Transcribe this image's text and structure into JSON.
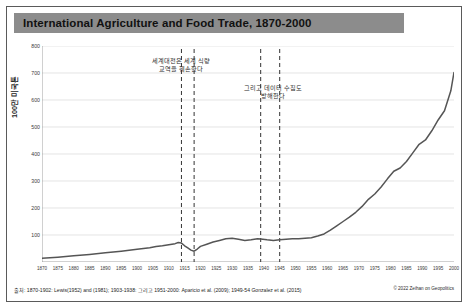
{
  "header": {
    "title": "International Agriculture and Food Trade, 1870-2000"
  },
  "footer": {
    "source": "출처: 1870-1902: Lewis(1952) and (1981); 1903-1938: 그리고 1951-2000: Aparicio et al. (2009); 1949-54 Gonzalez et al. (2015)",
    "credit": "© 2022 Zeihan on Geopolitics"
  },
  "annotations": [
    {
      "name": "world-wars-disrupt-trade",
      "line1": "세계대전은 세계 식량",
      "line2": "교역을 훼손한다"
    },
    {
      "name": "data-collection-disrupted",
      "line1": "그리고 데이터 수집도",
      "line2": "방해한다"
    }
  ],
  "colors": {
    "title_bar": "#8c8c8c",
    "line": "#555555",
    "grid": "#d9d9d9",
    "axis": "#8a8a8a",
    "marker_line": "#333333",
    "frame": "#5a5a5a"
  },
  "chart_data": {
    "type": "line",
    "title": "International Agriculture and Food Trade, 1870-2000",
    "xlabel": "",
    "ylabel": "100만 미국톤",
    "xlim": [
      1870,
      2000
    ],
    "ylim": [
      0,
      800
    ],
    "grid": true,
    "legend": "none",
    "xticks": [
      1870,
      1875,
      1880,
      1885,
      1890,
      1895,
      1900,
      1905,
      1910,
      1915,
      1920,
      1925,
      1930,
      1935,
      1940,
      1945,
      1950,
      1955,
      1960,
      1965,
      1970,
      1975,
      1980,
      1985,
      1990,
      1995,
      2000
    ],
    "yticks": [
      0,
      100,
      200,
      300,
      400,
      500,
      600,
      700,
      800
    ],
    "vlines": [
      {
        "x": 1914,
        "label": "WWI start"
      },
      {
        "x": 1918,
        "label": "WWI end"
      },
      {
        "x": 1939,
        "label": "WWII start"
      },
      {
        "x": 1945,
        "label": "WWII end"
      }
    ],
    "series": [
      {
        "name": "International agriculture and food trade",
        "x": [
          1870,
          1875,
          1880,
          1885,
          1890,
          1895,
          1900,
          1902,
          1904,
          1906,
          1908,
          1910,
          1912,
          1913,
          1914,
          1915,
          1916,
          1917,
          1918,
          1919,
          1920,
          1922,
          1924,
          1926,
          1928,
          1930,
          1932,
          1934,
          1936,
          1938,
          1939,
          1941,
          1943,
          1945,
          1947,
          1949,
          1951,
          1953,
          1955,
          1957,
          1959,
          1961,
          1963,
          1965,
          1967,
          1969,
          1971,
          1973,
          1975,
          1977,
          1979,
          1981,
          1983,
          1985,
          1987,
          1989,
          1991,
          1993,
          1995,
          1997,
          1999,
          2000
        ],
        "y": [
          14,
          18,
          23,
          28,
          34,
          40,
          47,
          50,
          53,
          57,
          60,
          64,
          68,
          72,
          70,
          60,
          52,
          44,
          40,
          48,
          58,
          66,
          74,
          80,
          86,
          88,
          84,
          80,
          82,
          86,
          85,
          82,
          80,
          82,
          84,
          86,
          86,
          88,
          90,
          96,
          104,
          118,
          134,
          150,
          166,
          184,
          206,
          232,
          252,
          278,
          308,
          336,
          348,
          372,
          404,
          436,
          452,
          486,
          526,
          560,
          634,
          702
        ]
      }
    ]
  }
}
